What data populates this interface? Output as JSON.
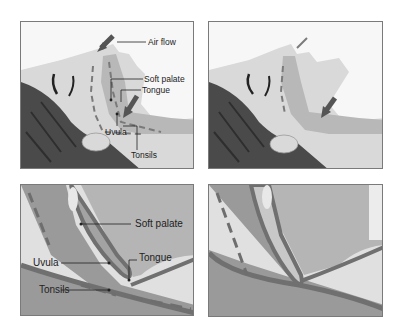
{
  "figure": {
    "panels": [
      {
        "id": "open-airway-head",
        "labels": {
          "air_flow": "Air flow",
          "soft_palate": "Soft palate",
          "tongue": "Tongue",
          "uvula": "Uvula",
          "tonsils": "Tonsils"
        }
      },
      {
        "id": "obstructed-airway-head"
      },
      {
        "id": "open-airway-closeup",
        "labels": {
          "soft_palate": "Soft palate",
          "tongue": "Tongue",
          "uvula": "Uvula",
          "tonsils": "Tonsils"
        }
      },
      {
        "id": "obstructed-airway-closeup"
      }
    ],
    "colors": {
      "frame": "#7a7a7a",
      "skin": "#dcdcdc",
      "hair": "#4a4a4a",
      "tissue": "#a8a8a8",
      "tissue_dark": "#707070",
      "arrow": "#6e6e6e"
    }
  }
}
